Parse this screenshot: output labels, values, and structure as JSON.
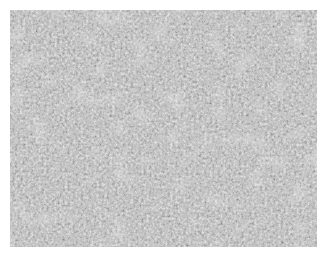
{
  "image": {
    "description": "Grayscale phase-contrast micrograph of densely packed cells",
    "background_color": "#ffffff",
    "mean_gray": "#7a7a7a",
    "dark_gray": "#2a2a2a",
    "light_gray": "#d8d8d8"
  }
}
